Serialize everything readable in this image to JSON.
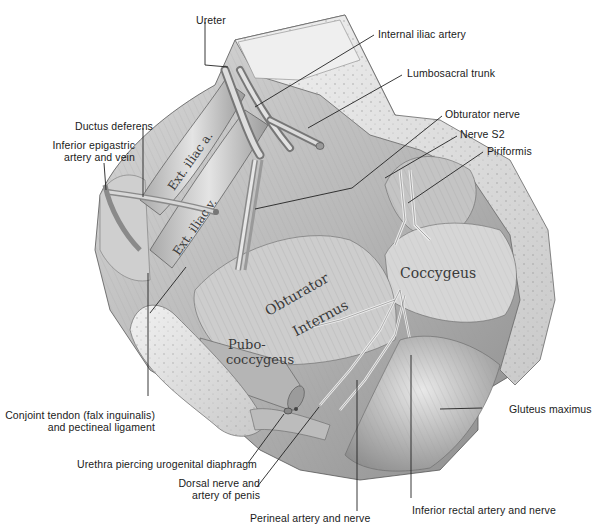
{
  "figure": {
    "type": "anatomical-illustration"
  },
  "callouts": {
    "ureter": "Ureter",
    "internal_iliac_artery": "Internal iliac artery",
    "lumbosacral_trunk": "Lumbosacral trunk",
    "obturator_nerve": "Obturator nerve",
    "nerve_s2": "Nerve S2",
    "piriformis": "Piriformis",
    "ductus_deferens": "Ductus deferens",
    "inferior_epigastric_1": "Inferior epigastric",
    "inferior_epigastric_2": "artery and vein",
    "conjoint_tendon_1": "Conjoint tendon (falx inguinalis)",
    "conjoint_tendon_2": "and pectineal ligament",
    "urethra": "Urethra piercing urogenital diaphragm",
    "dorsal_nerve_1": "Dorsal nerve and",
    "dorsal_nerve_2": "artery of penis",
    "perineal": "Perineal artery and nerve",
    "inferior_rectal": "Inferior rectal artery and nerve",
    "gluteus_maximus": "Gluteus maximus"
  },
  "inline_labels": {
    "ext_iliac_a": "Ext. iliac a.",
    "ext_iliac_v": "Ext. iliac v.",
    "obturator": "Obturator",
    "internus": "Internus",
    "pubo": "Pubo-",
    "coccygeus_pubo": "coccygeus",
    "coccygeus": "Coccygeus"
  },
  "colors": {
    "background": "#ffffff",
    "text": "#1a1a1a",
    "leader_line": "#222222",
    "tissue_light": "#e6e6e6",
    "tissue_mid": "#bdbdbd",
    "tissue_dark": "#6e6e6e"
  }
}
